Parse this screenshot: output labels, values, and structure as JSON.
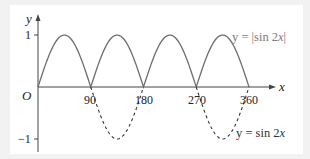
{
  "chart_data": {
    "type": "line",
    "title": "",
    "xlabel": "x",
    "ylabel": "y",
    "origin_label": "O",
    "xlim": [
      0,
      360
    ],
    "ylim": [
      -1,
      1
    ],
    "x_ticks": [
      "90",
      "180",
      "270",
      "360"
    ],
    "y_ticks": [
      "1",
      "-1"
    ],
    "y_tick_labels": {
      "top": "1",
      "bottom": "−1"
    },
    "grid": false,
    "series": [
      {
        "name": "y = |sin 2x|",
        "style": "solid",
        "color": "#666666",
        "x": [
          0,
          45,
          90,
          135,
          180,
          225,
          270,
          315,
          360
        ],
        "values": [
          0,
          1,
          0,
          1,
          0,
          1,
          0,
          1,
          0
        ]
      },
      {
        "name": "y = sin 2x",
        "style": "dashed",
        "color": "#333333",
        "note": "dashed only where sin 2x < 0 (90–180, 270–360)",
        "x": [
          0,
          45,
          90,
          135,
          180,
          225,
          270,
          315,
          360
        ],
        "values": [
          0,
          1,
          0,
          -1,
          0,
          1,
          0,
          -1,
          0
        ]
      }
    ],
    "annotations": [
      {
        "text": "y = |sin 2x|",
        "position": "upper right"
      },
      {
        "text": "y = sin 2x",
        "position": "lower right"
      }
    ]
  },
  "labels": {
    "y_axis": "y",
    "x_axis": "x",
    "origin": "O",
    "y_one": "1",
    "y_neg_one": "−1",
    "x_90": "90",
    "x_180": "180",
    "x_270": "270",
    "x_360": "360",
    "legend_abs_prefix": "y = |sin 2",
    "legend_abs_var": "x",
    "legend_abs_suffix": "|",
    "legend_sin_prefix": "y = sin 2",
    "legend_sin_var": "x"
  }
}
